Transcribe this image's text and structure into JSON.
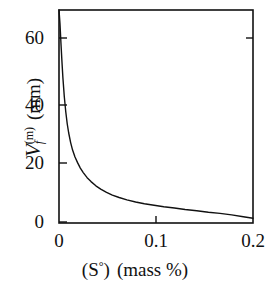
{
  "chart_data": {
    "type": "line",
    "title": "",
    "subtitle": "",
    "xlabel": "(S°)  (mass %)",
    "xlabel_parts": {
      "species": "(S",
      "degree": "°",
      "close": ")",
      "unit": "(mass %)"
    },
    "ylabel": "V_f^(m)  (mm)",
    "ylabel_parts": {
      "symbol": "V",
      "subscript": "f",
      "superscript": "(m)",
      "unit": "(mm)"
    },
    "xlim": [
      0,
      0.2
    ],
    "ylim": [
      0,
      71
    ],
    "xticks": [
      0,
      0.1,
      0.2
    ],
    "xticklabels": [
      "0",
      "0.1",
      "0.2"
    ],
    "yticks": [
      0,
      20,
      40,
      60
    ],
    "yticklabels": [
      "0",
      "20",
      "40",
      "60"
    ],
    "grid": false,
    "legend": null,
    "frame": "full-box",
    "tick_direction": "in",
    "line_color": "#111111",
    "line_width": 1.4,
    "series": [
      {
        "name": "Vf(m) vs (S°)",
        "x": [
          0.0,
          0.001,
          0.002,
          0.003,
          0.004,
          0.0055,
          0.007,
          0.0085,
          0.01,
          0.012,
          0.014,
          0.0165,
          0.019,
          0.022,
          0.025,
          0.029,
          0.033,
          0.038,
          0.043,
          0.049,
          0.055,
          0.062,
          0.07,
          0.079,
          0.088,
          0.098,
          0.108,
          0.119,
          0.13,
          0.142,
          0.154,
          0.166,
          0.178,
          0.19,
          0.2
        ],
        "y": [
          71.0,
          66.5,
          60.0,
          54.0,
          48.5,
          42.0,
          37.0,
          33.0,
          30.0,
          26.8,
          24.3,
          22.0,
          20.2,
          18.3,
          16.8,
          15.1,
          13.8,
          12.4,
          11.3,
          10.2,
          9.3,
          8.5,
          7.7,
          7.0,
          6.4,
          5.9,
          5.4,
          5.0,
          4.5,
          4.1,
          3.6,
          3.2,
          2.7,
          2.1,
          1.6
        ]
      }
    ],
    "annotations": []
  },
  "axes": {
    "y_ticks": [
      {
        "label": "60",
        "value": 60
      },
      {
        "label": "40",
        "value": 40
      },
      {
        "label": "20",
        "value": 20
      },
      {
        "label": "0",
        "value": 0
      }
    ],
    "x_ticks": [
      {
        "label": "0",
        "value": 0
      },
      {
        "label": "0.1",
        "value": 0.1
      },
      {
        "label": "0.2",
        "value": 0.2
      }
    ]
  }
}
